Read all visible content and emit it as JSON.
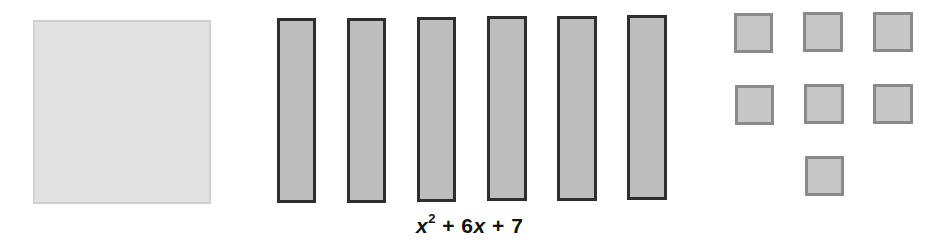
{
  "diagram": {
    "type": "algebra-tiles",
    "expression": {
      "var1": "x",
      "exp": "2",
      "op1": " + ",
      "coef": "6",
      "var2": "x",
      "op2": " + ",
      "const": "7",
      "full": "x^2 + 6x + 7"
    },
    "tiles": {
      "x_squared": {
        "count": 1,
        "fill": "#e1e1e1",
        "border": "#d0d0d0"
      },
      "x": {
        "count": 6,
        "fill": "#bdbdbd",
        "border": "#2e2e2e"
      },
      "unit": {
        "count": 7,
        "fill": "#c6c6c6",
        "border": "#8a8a8a"
      }
    }
  }
}
